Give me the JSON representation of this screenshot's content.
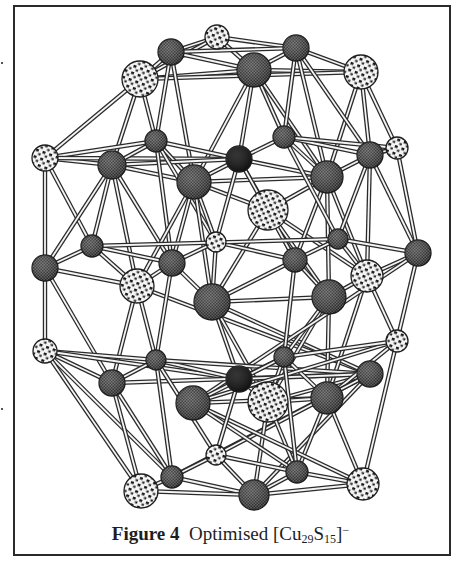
{
  "figure": {
    "label": "Figure 4",
    "title_prefix": "Optimised [Cu",
    "cu_count": "29",
    "s_label": "S",
    "s_count": "15",
    "title_suffix": "]",
    "charge": "−",
    "full_caption": "Figure 4 Optimised [Cu29S15]−"
  },
  "legend_styles": {
    "cu_fill": "#5a5a5a",
    "s_fill": "#f2f2f2",
    "s_spot": "#1a1a1a",
    "center_fill": "#111111",
    "bond_outer": "#2b2b2b",
    "bond_inner": "#f4f4f4"
  },
  "atoms": [
    {
      "type": "S",
      "x": 217,
      "y": 37,
      "r": 12
    },
    {
      "type": "Cu",
      "x": 171,
      "y": 52,
      "r": 13
    },
    {
      "type": "S",
      "x": 140,
      "y": 79,
      "r": 18
    },
    {
      "type": "Cu",
      "x": 296,
      "y": 48,
      "r": 13
    },
    {
      "type": "Cu",
      "x": 254,
      "y": 70,
      "r": 17
    },
    {
      "type": "S",
      "x": 361,
      "y": 72,
      "r": 17
    },
    {
      "type": "S",
      "x": 45,
      "y": 158,
      "r": 13
    },
    {
      "type": "Cu",
      "x": 112,
      "y": 165,
      "r": 14
    },
    {
      "type": "Cu",
      "x": 156,
      "y": 141,
      "r": 11
    },
    {
      "type": "X",
      "x": 239,
      "y": 159,
      "r": 13
    },
    {
      "type": "Cu",
      "x": 194,
      "y": 182,
      "r": 17
    },
    {
      "type": "Cu",
      "x": 284,
      "y": 137,
      "r": 11
    },
    {
      "type": "Cu",
      "x": 327,
      "y": 177,
      "r": 16
    },
    {
      "type": "Cu",
      "x": 370,
      "y": 155,
      "r": 13
    },
    {
      "type": "S",
      "x": 397,
      "y": 148,
      "r": 11
    },
    {
      "type": "S",
      "x": 268,
      "y": 210,
      "r": 20
    },
    {
      "type": "Cu",
      "x": 92,
      "y": 246,
      "r": 11
    },
    {
      "type": "S",
      "x": 216,
      "y": 242,
      "r": 10
    },
    {
      "type": "Cu",
      "x": 45,
      "y": 268,
      "r": 13
    },
    {
      "type": "Cu",
      "x": 172,
      "y": 263,
      "r": 13
    },
    {
      "type": "Cu",
      "x": 295,
      "y": 260,
      "r": 12
    },
    {
      "type": "Cu",
      "x": 338,
      "y": 239,
      "r": 10
    },
    {
      "type": "Cu",
      "x": 418,
      "y": 253,
      "r": 13
    },
    {
      "type": "S",
      "x": 137,
      "y": 286,
      "r": 17
    },
    {
      "type": "S",
      "x": 367,
      "y": 276,
      "r": 16
    },
    {
      "type": "Cu",
      "x": 212,
      "y": 302,
      "r": 18
    },
    {
      "type": "Cu",
      "x": 329,
      "y": 297,
      "r": 17
    },
    {
      "type": "S",
      "x": 45,
      "y": 351,
      "r": 12
    },
    {
      "type": "Cu",
      "x": 156,
      "y": 360,
      "r": 10
    },
    {
      "type": "S",
      "x": 397,
      "y": 341,
      "r": 11
    },
    {
      "type": "Cu",
      "x": 284,
      "y": 357,
      "r": 10
    },
    {
      "type": "X",
      "x": 239,
      "y": 379,
      "r": 13
    },
    {
      "type": "Cu",
      "x": 112,
      "y": 383,
      "r": 13
    },
    {
      "type": "Cu",
      "x": 370,
      "y": 374,
      "r": 13
    },
    {
      "type": "Cu",
      "x": 193,
      "y": 403,
      "r": 17
    },
    {
      "type": "S",
      "x": 268,
      "y": 402,
      "r": 20
    },
    {
      "type": "Cu",
      "x": 327,
      "y": 398,
      "r": 16
    },
    {
      "type": "S",
      "x": 216,
      "y": 455,
      "r": 10
    },
    {
      "type": "Cu",
      "x": 172,
      "y": 477,
      "r": 11
    },
    {
      "type": "Cu",
      "x": 297,
      "y": 472,
      "r": 11
    },
    {
      "type": "S",
      "x": 141,
      "y": 491,
      "r": 17
    },
    {
      "type": "S",
      "x": 363,
      "y": 484,
      "r": 16
    },
    {
      "type": "Cu",
      "x": 254,
      "y": 495,
      "r": 15
    }
  ],
  "bonds": [
    [
      0,
      1
    ],
    [
      0,
      3
    ],
    [
      0,
      2
    ],
    [
      0,
      4
    ],
    [
      1,
      2
    ],
    [
      1,
      4
    ],
    [
      1,
      3
    ],
    [
      3,
      4
    ],
    [
      3,
      5
    ],
    [
      4,
      5
    ],
    [
      2,
      4
    ],
    [
      2,
      5
    ],
    [
      2,
      7
    ],
    [
      2,
      8
    ],
    [
      2,
      6
    ],
    [
      1,
      8
    ],
    [
      1,
      10
    ],
    [
      4,
      10
    ],
    [
      4,
      11
    ],
    [
      4,
      12
    ],
    [
      4,
      9
    ],
    [
      3,
      11
    ],
    [
      3,
      12
    ],
    [
      5,
      12
    ],
    [
      5,
      13
    ],
    [
      5,
      14
    ],
    [
      3,
      13
    ],
    [
      6,
      7
    ],
    [
      6,
      8
    ],
    [
      6,
      9
    ],
    [
      7,
      8
    ],
    [
      7,
      10
    ],
    [
      8,
      9
    ],
    [
      8,
      10
    ],
    [
      9,
      10
    ],
    [
      9,
      11
    ],
    [
      9,
      12
    ],
    [
      9,
      15
    ],
    [
      10,
      15
    ],
    [
      11,
      12
    ],
    [
      11,
      13
    ],
    [
      12,
      13
    ],
    [
      12,
      15
    ],
    [
      13,
      14
    ],
    [
      14,
      11
    ],
    [
      10,
      12
    ],
    [
      7,
      9
    ],
    [
      6,
      18
    ],
    [
      6,
      16
    ],
    [
      7,
      16
    ],
    [
      7,
      18
    ],
    [
      7,
      19
    ],
    [
      7,
      23
    ],
    [
      8,
      17
    ],
    [
      8,
      19
    ],
    [
      10,
      17
    ],
    [
      10,
      19
    ],
    [
      10,
      25
    ],
    [
      10,
      23
    ],
    [
      15,
      20
    ],
    [
      15,
      25
    ],
    [
      15,
      26
    ],
    [
      15,
      24
    ],
    [
      12,
      20
    ],
    [
      12,
      26
    ],
    [
      12,
      24
    ],
    [
      13,
      22
    ],
    [
      13,
      24
    ],
    [
      14,
      22
    ],
    [
      13,
      21
    ],
    [
      11,
      21
    ],
    [
      9,
      20
    ],
    [
      9,
      17
    ],
    [
      16,
      18
    ],
    [
      16,
      19
    ],
    [
      16,
      23
    ],
    [
      17,
      19
    ],
    [
      17,
      20
    ],
    [
      17,
      25
    ],
    [
      18,
      23
    ],
    [
      19,
      23
    ],
    [
      19,
      25
    ],
    [
      20,
      21
    ],
    [
      20,
      26
    ],
    [
      21,
      22
    ],
    [
      21,
      24
    ],
    [
      22,
      24
    ],
    [
      24,
      26
    ],
    [
      25,
      26
    ],
    [
      20,
      25
    ],
    [
      16,
      21
    ],
    [
      18,
      27
    ],
    [
      18,
      32
    ],
    [
      23,
      32
    ],
    [
      23,
      28
    ],
    [
      23,
      33
    ],
    [
      25,
      31
    ],
    [
      25,
      33
    ],
    [
      25,
      35
    ],
    [
      26,
      35
    ],
    [
      26,
      36
    ],
    [
      26,
      30
    ],
    [
      24,
      36
    ],
    [
      24,
      29
    ],
    [
      22,
      29
    ],
    [
      22,
      34
    ],
    [
      19,
      28
    ],
    [
      20,
      30
    ],
    [
      27,
      32
    ],
    [
      27,
      28
    ],
    [
      27,
      31
    ],
    [
      28,
      31
    ],
    [
      28,
      33
    ],
    [
      32,
      33
    ],
    [
      32,
      28
    ],
    [
      31,
      33
    ],
    [
      31,
      35
    ],
    [
      31,
      30
    ],
    [
      30,
      35
    ],
    [
      30,
      36
    ],
    [
      30,
      34
    ],
    [
      34,
      36
    ],
    [
      34,
      29
    ],
    [
      29,
      30
    ],
    [
      33,
      35
    ],
    [
      35,
      36
    ],
    [
      29,
      36
    ],
    [
      27,
      38
    ],
    [
      27,
      40
    ],
    [
      32,
      40
    ],
    [
      32,
      38
    ],
    [
      28,
      37
    ],
    [
      28,
      38
    ],
    [
      33,
      38
    ],
    [
      33,
      42
    ],
    [
      33,
      37
    ],
    [
      35,
      42
    ],
    [
      35,
      39
    ],
    [
      36,
      39
    ],
    [
      36,
      41
    ],
    [
      34,
      41
    ],
    [
      34,
      39
    ],
    [
      29,
      41
    ],
    [
      31,
      37
    ],
    [
      30,
      39
    ],
    [
      37,
      38
    ],
    [
      37,
      39
    ],
    [
      37,
      42
    ],
    [
      38,
      40
    ],
    [
      38,
      42
    ],
    [
      39,
      42
    ],
    [
      39,
      41
    ],
    [
      40,
      42
    ],
    [
      41,
      42
    ]
  ]
}
